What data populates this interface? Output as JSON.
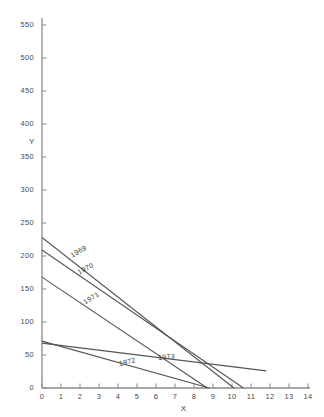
{
  "chart_data": {
    "type": "line",
    "title": "",
    "xlabel": "X",
    "ylabel": "Y",
    "xlim": [
      0,
      14
    ],
    "ylim": [
      0,
      550
    ],
    "grid": false,
    "legend_position": "inline-annotations",
    "xticks": [
      0,
      1,
      2,
      3,
      4,
      5,
      6,
      7,
      8,
      9,
      10,
      11,
      12,
      13,
      14
    ],
    "xtick_labels": [
      "0",
      "1",
      "2",
      "3",
      "4",
      "5",
      "6",
      "7",
      "8",
      "9",
      "10",
      "11",
      "12",
      "13",
      "14"
    ],
    "yticks": [
      0,
      50,
      100,
      150,
      200,
      250,
      300,
      350,
      400,
      450,
      500,
      550
    ],
    "ytick_labels": [
      "0",
      "50",
      "100",
      "150",
      "200",
      "250",
      "300",
      "350",
      "400",
      "450",
      "500",
      "550"
    ],
    "line_color": "#555555",
    "axis_color": "#8a8a8a",
    "series": [
      {
        "name": "1969",
        "x": [
          0,
          10.1
        ],
        "values": [
          228,
          0
        ],
        "label_x": 1.55,
        "label_y": 198,
        "label_rotation": -30
      },
      {
        "name": "1970",
        "x": [
          0,
          10.6
        ],
        "values": [
          209,
          0
        ],
        "label_x": 1.9,
        "label_y": 172,
        "label_rotation": -28
      },
      {
        "name": "1971",
        "x": [
          0,
          8.7
        ],
        "values": [
          168,
          0
        ],
        "label_x": 2.2,
        "label_y": 128,
        "label_rotation": -32
      },
      {
        "name": "1972",
        "x": [
          0,
          8.8
        ],
        "values": [
          71,
          0
        ],
        "label_x": 4.05,
        "label_y": 35,
        "label_rotation": -13
      },
      {
        "name": "1973",
        "x": [
          0,
          11.8
        ],
        "values": [
          68,
          26
        ],
        "label_x": 6.1,
        "label_y": 44,
        "label_rotation": -6
      }
    ]
  }
}
